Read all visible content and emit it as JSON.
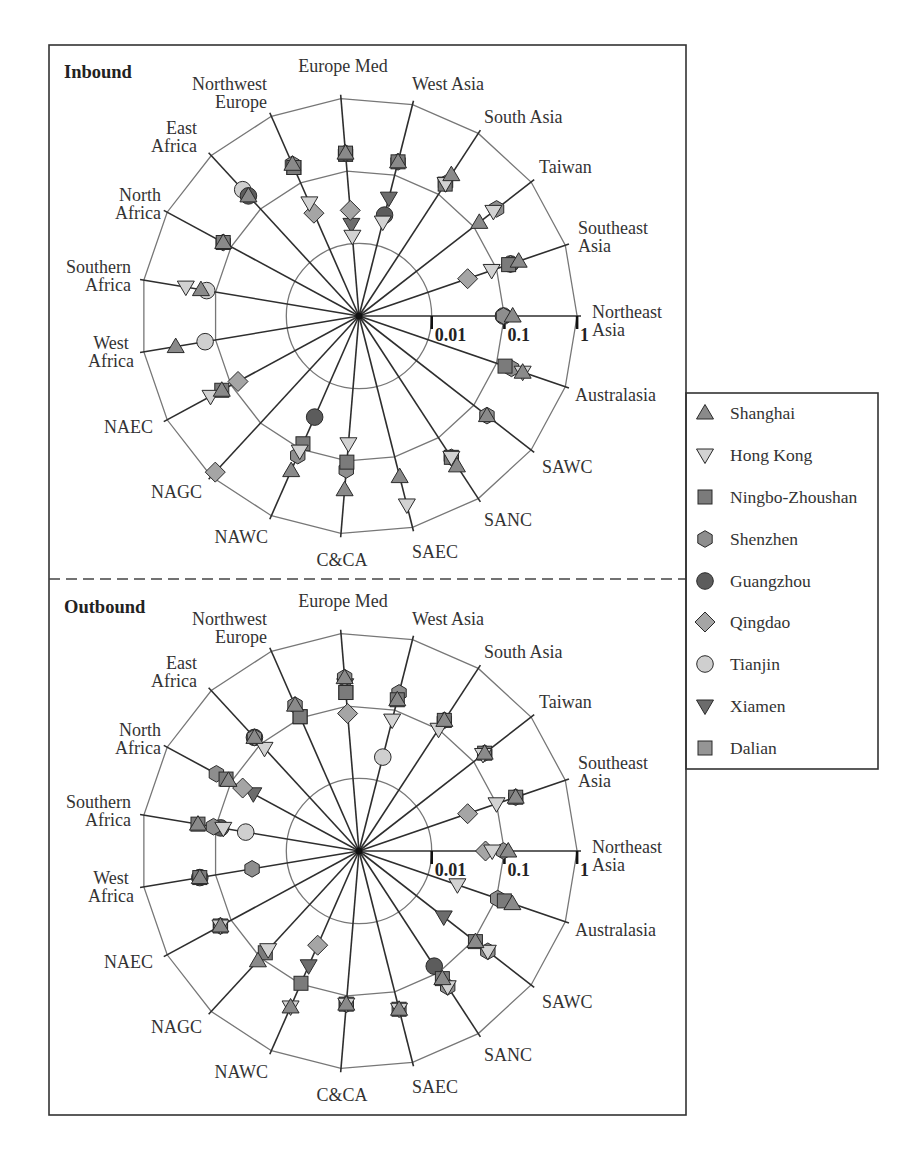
{
  "chart_data": {
    "type": "radar",
    "scale": "log",
    "ticks": [
      0.01,
      0.1,
      1
    ],
    "tick_labels": [
      "0.01",
      "0.1",
      "1"
    ],
    "grid": true,
    "legend_position": "right",
    "axes": [
      {
        "label": "Northeast Asia",
        "lines": [
          "Northeast",
          "Asia"
        ]
      },
      {
        "label": "Southeast Asia",
        "lines": [
          "Southeast",
          "Asia"
        ]
      },
      {
        "label": "Taiwan",
        "lines": [
          "Taiwan"
        ]
      },
      {
        "label": "South Asia",
        "lines": [
          "South Asia"
        ]
      },
      {
        "label": "West Asia",
        "lines": [
          "West Asia"
        ]
      },
      {
        "label": "Europe Med",
        "lines": [
          "Europe Med"
        ]
      },
      {
        "label": "Northwest Europe",
        "lines": [
          "Northwest",
          "Europe"
        ]
      },
      {
        "label": "East Africa",
        "lines": [
          "East",
          "Africa"
        ]
      },
      {
        "label": "North Africa",
        "lines": [
          "North",
          "Africa"
        ]
      },
      {
        "label": "Southern Africa",
        "lines": [
          "Southern",
          "Africa"
        ]
      },
      {
        "label": "West Africa",
        "lines": [
          "West",
          "Africa"
        ]
      },
      {
        "label": "NAEC",
        "lines": [
          "NAEC"
        ]
      },
      {
        "label": "NAGC",
        "lines": [
          "NAGC"
        ]
      },
      {
        "label": "NAWC",
        "lines": [
          "NAWC"
        ]
      },
      {
        "label": "C&CA",
        "lines": [
          "C&CA"
        ]
      },
      {
        "label": "SAEC",
        "lines": [
          "SAEC"
        ]
      },
      {
        "label": "SANC",
        "lines": [
          "SANC"
        ]
      },
      {
        "label": "SAWC",
        "lines": [
          "SAWC"
        ]
      },
      {
        "label": "Australasia",
        "lines": [
          "Australasia"
        ]
      }
    ],
    "legend": [
      {
        "name": "Shanghai",
        "shape": "triangle-up",
        "color": "#8a8a8a"
      },
      {
        "name": "Hong Kong",
        "shape": "triangle-down",
        "color": "#d2d2d2"
      },
      {
        "name": "Ningbo-Zhoushan",
        "shape": "square",
        "color": "#7b7b7b"
      },
      {
        "name": "Shenzhen",
        "shape": "hexagon",
        "color": "#8e8e8e"
      },
      {
        "name": "Guangzhou",
        "shape": "circle",
        "color": "#5c5c5c"
      },
      {
        "name": "Qingdao",
        "shape": "diamond",
        "color": "#a5a5a5"
      },
      {
        "name": "Tianjin",
        "shape": "circle",
        "color": "#cfcfcf"
      },
      {
        "name": "Xiamen",
        "shape": "triangle-down",
        "color": "#6c6c6c"
      },
      {
        "name": "Dalian",
        "shape": "square",
        "color": "#959595"
      }
    ],
    "panels": [
      {
        "title": "Inbound",
        "values": {
          "Shanghai": [
            0.13,
            0.21,
            0.125,
            0.21,
            0.154,
            0.177,
            0.19,
            0.176,
            0.133,
            0.16,
            0.36,
            0.14,
            null,
            0.21,
            0.25,
            0.19,
            0.29,
            0.17,
            0.24
          ],
          "Hong Kong": [
            null,
            0.085,
            0.22,
            0.15,
            0.0215,
            0.0126,
            0.05,
            null,
            null,
            0.26,
            null,
            0.21,
            null,
            0.107,
            0.058,
            0.48,
            0.21,
            null,
            0.24
          ],
          "Ningbo-Zhoushan": [
            null,
            0.15,
            null,
            0.147,
            0.154,
            0.177,
            0.17,
            null,
            0.133,
            null,
            null,
            0.14,
            null,
            0.083,
            0.104,
            null,
            0.21,
            null,
            0.133
          ],
          "Shenzhen": [
            0.097,
            0.16,
            0.25,
            0.15,
            0.154,
            0.177,
            0.19,
            null,
            0.133,
            null,
            null,
            null,
            null,
            0.125,
            0.133,
            null,
            0.21,
            0.17,
            0.165
          ],
          "Guangzhou": [
            0.097,
            0.16,
            null,
            null,
            0.027,
            null,
            null,
            0.176,
            null,
            null,
            null,
            null,
            null,
            0.033,
            null,
            null,
            null,
            null,
            null
          ],
          "Qingdao": [
            null,
            0.038,
            null,
            null,
            null,
            0.0287,
            0.035,
            null,
            null,
            null,
            null,
            0.078,
            0.83,
            null,
            null,
            null,
            null,
            null,
            null
          ],
          "Tianjin": [
            null,
            null,
            null,
            null,
            null,
            null,
            null,
            0.23,
            null,
            0.133,
            0.14,
            null,
            null,
            null,
            null,
            null,
            null,
            null,
            null
          ],
          "Xiamen": [
            null,
            null,
            null,
            null,
            0.047,
            0.0184,
            null,
            null,
            null,
            null,
            null,
            null,
            null,
            null,
            null,
            null,
            null,
            null,
            null
          ],
          "Dalian": [
            null,
            null,
            null,
            null,
            null,
            0.17,
            0.17,
            null,
            null,
            null,
            null,
            null,
            null,
            null,
            null,
            null,
            null,
            null,
            null
          ]
        }
      },
      {
        "title": "Outbound",
        "values": {
          "Shanghai": [
            0.113,
            0.19,
            0.155,
            0.14,
            0.14,
            0.247,
            0.155,
            0.133,
            0.11,
            0.176,
            0.166,
            0.147,
            0.113,
            0.22,
            0.13,
            0.176,
            0.125,
            0.107,
            0.17
          ],
          "Hong Kong": [
            0.068,
            0.1,
            0.145,
            0.1,
            0.072,
            null,
            null,
            0.083,
            null,
            0.078,
            null,
            0.147,
            0.07,
            0.22,
            0.13,
            0.176,
            0.17,
            0.176,
            0.027
          ],
          "Ningbo-Zhoushan": [
            null,
            0.19,
            0.155,
            0.14,
            0.14,
            0.154,
            0.104,
            null,
            0.12,
            0.176,
            0.166,
            0.147,
            0.08,
            0.097,
            0.13,
            0.176,
            0.125,
            0.107,
            0.13
          ],
          "Shenzhen": [
            0.097,
            0.19,
            0.155,
            0.14,
            0.175,
            0.247,
            0.155,
            0.133,
            0.17,
            0.107,
            0.031,
            0.147,
            null,
            null,
            0.13,
            null,
            0.17,
            0.176,
            0.104
          ],
          "Guangzhou": [
            null,
            null,
            null,
            null,
            null,
            null,
            null,
            0.133,
            null,
            0.085,
            0.166,
            null,
            null,
            null,
            null,
            null,
            0.078,
            null,
            null
          ],
          "Qingdao": [
            0.055,
            0.038,
            null,
            null,
            null,
            0.079,
            null,
            null,
            0.066,
            null,
            null,
            null,
            null,
            0.026,
            null,
            null,
            null,
            null,
            null
          ],
          "Tianjin": [
            null,
            null,
            null,
            null,
            0.0215,
            null,
            null,
            null,
            null,
            0.038,
            null,
            null,
            null,
            null,
            null,
            null,
            null,
            null,
            null
          ],
          "Xiamen": [
            null,
            null,
            null,
            null,
            null,
            0.197,
            null,
            null,
            0.045,
            null,
            null,
            null,
            null,
            0.053,
            null,
            null,
            null,
            0.03,
            null
          ],
          "Dalian": [
            null,
            null,
            null,
            null,
            null,
            0.154,
            0.104,
            null,
            null,
            null,
            null,
            null,
            null,
            null,
            null,
            null,
            null,
            null,
            null
          ]
        }
      }
    ]
  }
}
